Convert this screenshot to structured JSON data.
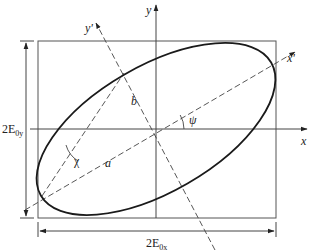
{
  "diagram": {
    "type": "polarization-ellipse",
    "labels": {
      "x_axis": "x",
      "y_axis": "y",
      "x_prime": "x'",
      "y_prime": "y'",
      "semi_major": "a",
      "semi_minor": "b",
      "orientation_angle": "ψ",
      "ellipticity_angle": "χ",
      "height_dim": "2E",
      "height_dim_sub": "0y",
      "width_dim": "2E",
      "width_dim_sub": "0x"
    },
    "colors": {
      "stroke": "#333333",
      "ellipse": "#1a1a1a",
      "background": "#ffffff"
    }
  }
}
